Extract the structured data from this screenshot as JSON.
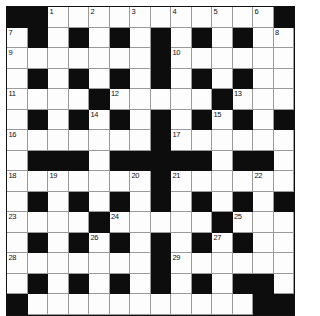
{
  "puzzle": {
    "kind": "crossword-grid",
    "rows": 14,
    "columns": 14,
    "colors": {
      "block": "#0d0d0d",
      "open": "#fdfdfd",
      "grid_line": "#9a9a9a",
      "border": "#111111",
      "number_text": "#111111",
      "page_background": "#ffffff"
    },
    "layout": {
      "cell_size_px": 20.5,
      "grid_origin_x_px": 6,
      "grid_origin_y_px": 6
    },
    "clue_numbers": [
      1,
      2,
      3,
      4,
      5,
      6,
      7,
      8,
      9,
      10,
      11,
      12,
      13,
      14,
      15,
      16,
      17,
      18,
      19,
      20,
      21,
      22,
      23,
      24,
      25,
      26,
      27,
      28,
      29,
      30
    ],
    "grid": [
      [
        "B",
        "B",
        "W",
        "W",
        "W",
        "W",
        "W",
        "W",
        "W",
        "W",
        "W",
        "W",
        "W",
        "B"
      ],
      [
        "W",
        "B",
        "W",
        "B",
        "W",
        "B",
        "W",
        "B",
        "W",
        "B",
        "W",
        "B",
        "W",
        "W"
      ],
      [
        "W",
        "W",
        "W",
        "W",
        "W",
        "W",
        "W",
        "B",
        "W",
        "W",
        "W",
        "W",
        "W",
        "W"
      ],
      [
        "W",
        "B",
        "W",
        "B",
        "W",
        "B",
        "W",
        "B",
        "W",
        "B",
        "W",
        "B",
        "W",
        "W"
      ],
      [
        "W",
        "W",
        "W",
        "W",
        "B",
        "W",
        "W",
        "W",
        "W",
        "W",
        "B",
        "W",
        "W",
        "W"
      ],
      [
        "W",
        "B",
        "W",
        "B",
        "W",
        "B",
        "W",
        "B",
        "W",
        "B",
        "W",
        "B",
        "W",
        "B"
      ],
      [
        "W",
        "W",
        "W",
        "W",
        "W",
        "W",
        "W",
        "B",
        "W",
        "W",
        "W",
        "W",
        "W",
        "W"
      ],
      [
        "W",
        "B",
        "B",
        "B",
        "W",
        "B",
        "B",
        "B",
        "B",
        "B",
        "W",
        "B",
        "B",
        "W"
      ],
      [
        "W",
        "W",
        "W",
        "W",
        "W",
        "W",
        "W",
        "B",
        "W",
        "W",
        "W",
        "W",
        "W",
        "W"
      ],
      [
        "W",
        "B",
        "W",
        "B",
        "W",
        "B",
        "W",
        "B",
        "W",
        "B",
        "W",
        "B",
        "W",
        "B"
      ],
      [
        "W",
        "W",
        "W",
        "W",
        "B",
        "W",
        "W",
        "W",
        "W",
        "W",
        "B",
        "W",
        "W",
        "W"
      ],
      [
        "W",
        "B",
        "W",
        "B",
        "W",
        "B",
        "W",
        "B",
        "W",
        "B",
        "W",
        "B",
        "W",
        "W"
      ],
      [
        "W",
        "W",
        "W",
        "W",
        "W",
        "W",
        "W",
        "B",
        "W",
        "W",
        "W",
        "W",
        "W",
        "W"
      ],
      [
        "W",
        "B",
        "W",
        "B",
        "W",
        "B",
        "W",
        "B",
        "W",
        "B",
        "W",
        "B",
        "B",
        "W"
      ],
      [
        "B",
        "W",
        "W",
        "W",
        "W",
        "W",
        "W",
        "W",
        "W",
        "W",
        "W",
        "W",
        "B",
        "B"
      ]
    ],
    "numbered_cells": [
      {
        "n": 1,
        "row": 0,
        "col": 2
      },
      {
        "n": 2,
        "row": 0,
        "col": 4
      },
      {
        "n": 3,
        "row": 0,
        "col": 6
      },
      {
        "n": 4,
        "row": 0,
        "col": 8
      },
      {
        "n": 5,
        "row": 0,
        "col": 10
      },
      {
        "n": 6,
        "row": 0,
        "col": 12
      },
      {
        "n": 7,
        "row": 1,
        "col": 0
      },
      {
        "n": 8,
        "row": 1,
        "col": 13
      },
      {
        "n": 9,
        "row": 2,
        "col": 0
      },
      {
        "n": 10,
        "row": 2,
        "col": 8
      },
      {
        "n": 11,
        "row": 4,
        "col": 0
      },
      {
        "n": 12,
        "row": 4,
        "col": 5
      },
      {
        "n": 13,
        "row": 4,
        "col": 11
      },
      {
        "n": 14,
        "row": 5,
        "col": 4
      },
      {
        "n": 15,
        "row": 5,
        "col": 10
      },
      {
        "n": 16,
        "row": 6,
        "col": 0
      },
      {
        "n": 17,
        "row": 6,
        "col": 8
      },
      {
        "n": 18,
        "row": 8,
        "col": 0
      },
      {
        "n": 19,
        "row": 8,
        "col": 2
      },
      {
        "n": 20,
        "row": 8,
        "col": 6
      },
      {
        "n": 21,
        "row": 8,
        "col": 8
      },
      {
        "n": 22,
        "row": 8,
        "col": 12
      },
      {
        "n": 23,
        "row": 10,
        "col": 0
      },
      {
        "n": 24,
        "row": 10,
        "col": 5
      },
      {
        "n": 25,
        "row": 10,
        "col": 11
      },
      {
        "n": 26,
        "row": 11,
        "col": 4
      },
      {
        "n": 27,
        "row": 11,
        "col": 10
      },
      {
        "n": 28,
        "row": 12,
        "col": 0
      },
      {
        "n": 29,
        "row": 12,
        "col": 8
      },
      {
        "n": 30,
        "row": 13,
        "col": 1
      }
    ]
  }
}
